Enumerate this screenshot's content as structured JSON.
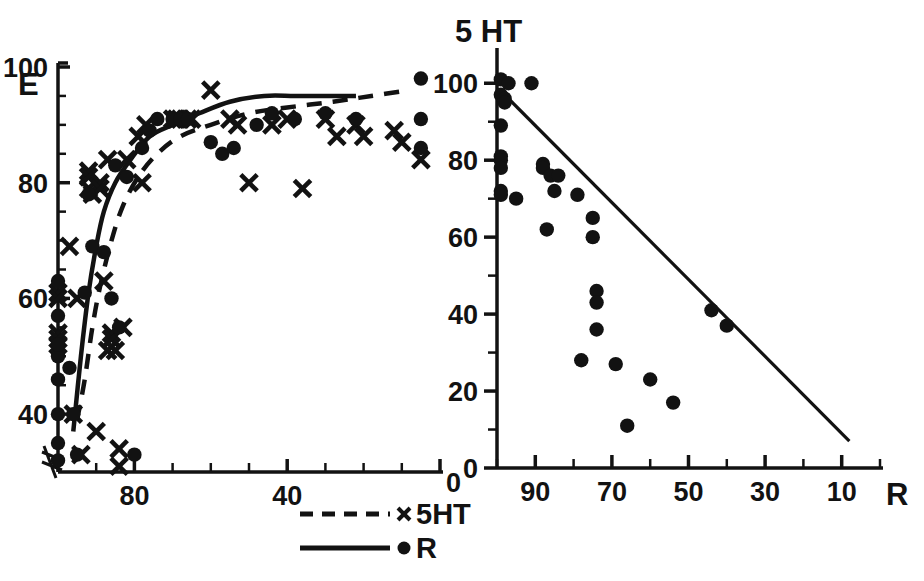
{
  "figure": {
    "background": "#ffffff",
    "ink_color": "#121212"
  },
  "chart_data": [
    {
      "id": "left-panel",
      "type": "scatter",
      "title": "",
      "xlabel": "",
      "ylabel": "E",
      "xlim": [
        100,
        0
      ],
      "ylim": [
        30,
        100
      ],
      "x_reversed": true,
      "grid": false,
      "x_ticks": [
        100,
        90,
        80,
        70,
        60,
        50,
        40,
        30,
        20,
        10,
        0
      ],
      "x_tick_labels": [
        "",
        "",
        "80",
        "",
        "",
        "",
        "40",
        "",
        "",
        "",
        "0"
      ],
      "y_ticks": [
        40,
        45,
        50,
        55,
        60,
        65,
        70,
        75,
        80,
        85,
        90,
        95,
        100
      ],
      "y_tick_labels": [
        "40",
        "",
        "",
        "",
        "60",
        "",
        "",
        "",
        "80",
        "",
        "",
        "",
        "100"
      ],
      "axis_break": true,
      "legend_position": "below-right",
      "series": [
        {
          "name": "5HT",
          "marker": "x",
          "line": "dashed",
          "points": [
            [
              100,
              61
            ],
            [
              100,
              60
            ],
            [
              100,
              54
            ],
            [
              100,
              53
            ],
            [
              100,
              52
            ],
            [
              97,
              69
            ],
            [
              96,
              40
            ],
            [
              95,
              60
            ],
            [
              94,
              33
            ],
            [
              92,
              82
            ],
            [
              92,
              81
            ],
            [
              92,
              79
            ],
            [
              91,
              78
            ],
            [
              90,
              37
            ],
            [
              89,
              80
            ],
            [
              89,
              79
            ],
            [
              88,
              63
            ],
            [
              87,
              51
            ],
            [
              87,
              84
            ],
            [
              86,
              54
            ],
            [
              86,
              53
            ],
            [
              85,
              51
            ],
            [
              84,
              34
            ],
            [
              84,
              31
            ],
            [
              83,
              55
            ],
            [
              82,
              84
            ],
            [
              79,
              88
            ],
            [
              78,
              80
            ],
            [
              77,
              90
            ],
            [
              70,
              91
            ],
            [
              69,
              91
            ],
            [
              68,
              91
            ],
            [
              66,
              91
            ],
            [
              65,
              91
            ],
            [
              60,
              96
            ],
            [
              55,
              91
            ],
            [
              53,
              90
            ],
            [
              50,
              80
            ],
            [
              44,
              90
            ],
            [
              40,
              91
            ],
            [
              36,
              79
            ],
            [
              30,
              91
            ],
            [
              27,
              88
            ],
            [
              22,
              90
            ],
            [
              20,
              88
            ],
            [
              12,
              89
            ],
            [
              10,
              87
            ],
            [
              5,
              84
            ]
          ],
          "fit_curve": [
            [
              95,
              39
            ],
            [
              93,
              46
            ],
            [
              91,
              55
            ],
            [
              89,
              62
            ],
            [
              86,
              70
            ],
            [
              83,
              76
            ],
            [
              79,
              81
            ],
            [
              74,
              85
            ],
            [
              68,
              88
            ],
            [
              60,
              90
            ],
            [
              50,
              92
            ],
            [
              40,
              93
            ],
            [
              28,
              94
            ],
            [
              18,
              95
            ],
            [
              8,
              96
            ]
          ]
        },
        {
          "name": "R",
          "marker": "circle",
          "line": "solid",
          "points": [
            [
              100,
              63
            ],
            [
              100,
              57
            ],
            [
              100,
              50
            ],
            [
              100,
              46
            ],
            [
              100,
              40
            ],
            [
              100,
              35
            ],
            [
              100,
              32
            ],
            [
              100,
              52
            ],
            [
              97,
              48
            ],
            [
              96,
              40
            ],
            [
              95,
              33
            ],
            [
              93,
              61
            ],
            [
              92,
              78
            ],
            [
              91,
              69
            ],
            [
              88,
              68
            ],
            [
              86,
              60
            ],
            [
              85,
              83
            ],
            [
              84,
              55
            ],
            [
              82,
              81
            ],
            [
              80,
              33
            ],
            [
              78,
              86
            ],
            [
              76,
              89
            ],
            [
              74,
              91
            ],
            [
              70,
              91
            ],
            [
              68,
              91
            ],
            [
              66,
              91
            ],
            [
              60,
              87
            ],
            [
              57,
              85
            ],
            [
              54,
              86
            ],
            [
              48,
              90
            ],
            [
              44,
              92
            ],
            [
              38,
              91
            ],
            [
              30,
              92
            ],
            [
              22,
              91
            ],
            [
              5,
              98
            ],
            [
              5,
              91
            ],
            [
              5,
              86
            ]
          ],
          "fit_curve": [
            [
              96,
              37
            ],
            [
              94,
              50
            ],
            [
              92,
              61
            ],
            [
              90,
              69
            ],
            [
              88,
              75
            ],
            [
              85,
              80
            ],
            [
              81,
              84
            ],
            [
              76,
              88
            ],
            [
              70,
              90
            ],
            [
              63,
              92
            ],
            [
              55,
              94
            ],
            [
              46,
              95
            ],
            [
              38,
              95
            ],
            [
              30,
              95
            ],
            [
              22,
              95
            ]
          ]
        }
      ]
    },
    {
      "id": "right-panel",
      "type": "scatter",
      "title": "",
      "xlabel": "R",
      "ylabel": "5 HT",
      "xlim": [
        100,
        0
      ],
      "ylim": [
        0,
        105
      ],
      "x_reversed": true,
      "grid": false,
      "x_ticks": [
        100,
        90,
        80,
        70,
        60,
        50,
        40,
        30,
        20,
        10,
        0
      ],
      "x_tick_labels": [
        "",
        "90",
        "",
        "70",
        "",
        "50",
        "",
        "30",
        "",
        "10",
        ""
      ],
      "y_ticks": [
        0,
        10,
        20,
        30,
        40,
        50,
        60,
        70,
        80,
        90,
        100
      ],
      "y_tick_labels": [
        "0",
        "",
        "20",
        "",
        "40",
        "",
        "60",
        "",
        "80",
        "",
        "100"
      ],
      "series": [
        {
          "name": "5HT vs R",
          "marker": "circle",
          "line": "solid",
          "points": [
            [
              99,
              101
            ],
            [
              97,
              100
            ],
            [
              99,
              97
            ],
            [
              98,
              96
            ],
            [
              98,
              95
            ],
            [
              99,
              89
            ],
            [
              99,
              81
            ],
            [
              99,
              80
            ],
            [
              99,
              78
            ],
            [
              99,
              72
            ],
            [
              99,
              71
            ],
            [
              91,
              100
            ],
            [
              95,
              70
            ],
            [
              88,
              79
            ],
            [
              88,
              78
            ],
            [
              86,
              76
            ],
            [
              85,
              72
            ],
            [
              87,
              62
            ],
            [
              84,
              76
            ],
            [
              79,
              71
            ],
            [
              75,
              65
            ],
            [
              75,
              60
            ],
            [
              74,
              46
            ],
            [
              74,
              43
            ],
            [
              74,
              36
            ],
            [
              78,
              28
            ],
            [
              69,
              27
            ],
            [
              66,
              11
            ],
            [
              60,
              23
            ],
            [
              54,
              17
            ],
            [
              44,
              41
            ],
            [
              40,
              37
            ]
          ],
          "fit_line": {
            "x1": 98,
            "y1": 97,
            "x2": 8,
            "y2": 7
          }
        }
      ]
    }
  ],
  "legend": {
    "entries": [
      {
        "label": "5HT",
        "line": "dashed",
        "marker": "x"
      },
      {
        "label": "R",
        "line": "solid",
        "marker": "circle"
      }
    ]
  },
  "labels": {
    "left_y": "E",
    "left_x_zero": "0",
    "right_y": "5 HT",
    "right_x": "R"
  }
}
